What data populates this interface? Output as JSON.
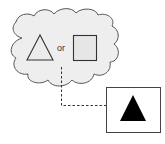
{
  "diagram": {
    "cloud": {
      "fill": "#eeeeee",
      "stroke": "#555555",
      "options": [
        {
          "shape": "triangle",
          "fill": "#eeeeee",
          "stroke": "#333333"
        },
        {
          "shape": "square",
          "fill": "#e6e6e6",
          "stroke": "#333333"
        }
      ],
      "connector_text": "or"
    },
    "arrow": {
      "style": "dashed",
      "color": "#333333"
    },
    "result_box": {
      "stroke": "#444444",
      "content": {
        "shape": "triangle",
        "fill": "#000000"
      }
    }
  }
}
